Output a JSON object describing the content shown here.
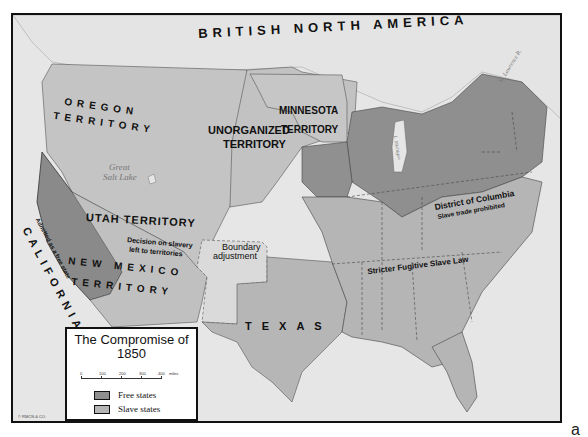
{
  "map": {
    "title": "The Compromise of 1850",
    "title_line1": "The Compromise of",
    "title_line2": "1850",
    "colors": {
      "free_states": "#8f8f8f",
      "slave_states": "#b5b5b5",
      "territory": "#c4c4c4",
      "water": "#e6e6e6",
      "california": "#8a8a8a"
    },
    "region_labels": {
      "british_north_america": "BRITISH NORTH AMERICA",
      "oregon_line1": "OREGON",
      "oregon_line2": "TERRITORY",
      "minnesota_line1": "MINNESOTA",
      "minnesota_line2": "TERRITORY",
      "unorganized_line1": "UNORGANIZED",
      "unorganized_line2": "TERRITORY",
      "utah": "UTAH TERRITORY",
      "new_mexico_line1": "NEW MEXICO",
      "new_mexico_line2": "TERRITORY",
      "texas": "TEXAS",
      "california": "CALIFORNIA"
    },
    "annotations": {
      "california_note": "Admitted as a free state",
      "decision_line1": "Decision on slavery",
      "decision_line2": "left to territories",
      "boundary_line1": "Boundary",
      "boundary_line2": "adjustment",
      "dc_line1": "District of Columbia",
      "dc_line2": "Slave trade prohibited",
      "fugitive": "Stricter Fugitive Slave Law"
    },
    "water_labels": {
      "great_salt_lake_line1": "Great",
      "great_salt_lake_line2": "Salt Lake",
      "st_lawrence": "St. Lawrence R.",
      "lake_michigan": "L. Michigan",
      "mississippi": "Mississippi R.",
      "ohio": "Ohio R."
    },
    "legend": {
      "scale_ticks": [
        "0",
        "100",
        "200",
        "300",
        "400"
      ],
      "scale_unit": "miles",
      "items": [
        {
          "label": "Free states",
          "color": "#8f8f8f"
        },
        {
          "label": "Slave states",
          "color": "#b5b5b5"
        }
      ]
    },
    "copyright": "© RMCN & CO.",
    "panel_letter": "a"
  }
}
